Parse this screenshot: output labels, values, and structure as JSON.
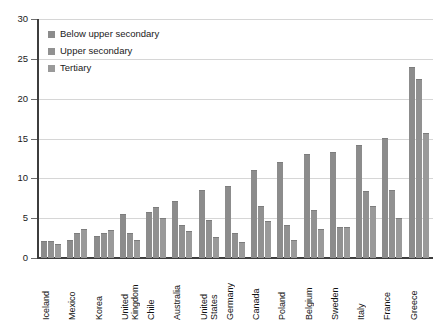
{
  "chart_data": {
    "type": "bar",
    "title": "",
    "subtitle": "",
    "xlabel": "",
    "ylabel": "",
    "ylim": [
      0,
      30
    ],
    "ytick_values": [
      0,
      5,
      10,
      15,
      20,
      25,
      30
    ],
    "ytick_labels": [
      "0",
      "5",
      "10",
      "15",
      "20",
      "25",
      "30"
    ],
    "grid": true,
    "grid_axis": "y",
    "legend_position": "upper left inside plot",
    "bar_orientation": "vertical",
    "grouped": true,
    "categories": [
      "Iceland",
      "Mexico",
      "Korea",
      "United Kingdom",
      "Chile",
      "Australia",
      "United States",
      "Germany",
      "Canada",
      "Poland",
      "Belgium",
      "Sweden",
      "Italy",
      "France",
      "Greece"
    ],
    "series": [
      {
        "name": "Below upper secondary",
        "color": "#8c8c8c",
        "values": [
          2.1,
          2.3,
          2.8,
          5.5,
          5.8,
          7.1,
          8.5,
          9.1,
          11.1,
          12.0,
          13.1,
          13.3,
          14.2,
          15.1,
          24.0
        ]
      },
      {
        "name": "Upper secondary",
        "color": "#919191",
        "values": [
          2.1,
          3.2,
          3.2,
          3.2,
          6.4,
          4.1,
          4.8,
          3.2,
          6.5,
          4.2,
          6.0,
          3.9,
          8.4,
          8.5,
          22.5
        ]
      },
      {
        "name": "Tertiary",
        "color": "#9a9a9a",
        "values": [
          1.7,
          3.7,
          3.5,
          2.3,
          5.0,
          3.4,
          2.6,
          2.0,
          4.6,
          2.3,
          3.6,
          3.9,
          6.5,
          5.0,
          15.7
        ]
      }
    ],
    "axis_color": "#3d3d3d",
    "gridline_color": "#d6d6d6",
    "background_color": "#ffffff"
  },
  "legend": {
    "entries": [
      {
        "label": "Below upper secondary"
      },
      {
        "label": "Upper secondary"
      },
      {
        "label": "Tertiary"
      }
    ]
  }
}
